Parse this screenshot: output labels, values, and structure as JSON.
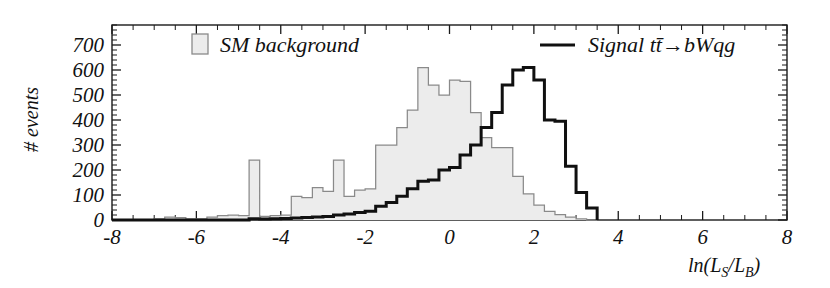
{
  "figure": {
    "name": "likelihood-ratio-discriminant",
    "width": 830,
    "height": 288
  },
  "axes": {
    "x": {
      "label": "ln(L_S/L_B)",
      "label_parts": {
        "ln_open": "ln(L",
        "sub_s": "S",
        "slash": "/L",
        "sub_b": "B",
        "close": ")"
      },
      "min": -8,
      "max": 8,
      "tick_labels": [
        "-8",
        "-6",
        "-4",
        "-2",
        "0",
        "2",
        "4",
        "6",
        "8"
      ],
      "tick_values": [
        -8,
        -6,
        -4,
        -2,
        0,
        2,
        4,
        6,
        8
      ],
      "minor_per_major": 4
    },
    "y": {
      "label": "# events",
      "min": 0,
      "max": 780,
      "tick_labels": [
        "0",
        "100",
        "200",
        "300",
        "400",
        "500",
        "600",
        "700"
      ],
      "tick_values": [
        0,
        100,
        200,
        300,
        400,
        500,
        600,
        700
      ],
      "minor_per_major": 5
    }
  },
  "legend": {
    "position": "top",
    "entries": [
      {
        "label": "SM background",
        "marker": "filled-square",
        "fill_color": "#ececec",
        "edge_color": "#8a8a8a"
      },
      {
        "label_plain": "Signal tt̄→bWqg",
        "label_prefix": "Signal t",
        "label_tbar": "t̄",
        "label_suffix": "→bWqg",
        "marker": "line",
        "line_color": "#101010"
      }
    ]
  },
  "chart_data": {
    "type": "line",
    "subtype": "step-histogram",
    "title": "",
    "xlabel": "ln(L_S/L_B)",
    "ylabel": "# events",
    "xlim": [
      -8,
      8
    ],
    "ylim": [
      0,
      780
    ],
    "grid": false,
    "legend_position": "top",
    "bin_width": 0.25,
    "bin_edges_start": -8,
    "series": [
      {
        "name": "SM background",
        "style": "filled-step",
        "fill_color": "#ececec",
        "edge_color": "#8a8a8a",
        "bin_centers": [
          -7.875,
          -7.625,
          -7.375,
          -7.125,
          -6.875,
          -6.625,
          -6.375,
          -6.125,
          -5.875,
          -5.625,
          -5.375,
          -5.125,
          -4.875,
          -4.625,
          -4.375,
          -4.125,
          -3.875,
          -3.625,
          -3.375,
          -3.125,
          -2.875,
          -2.625,
          -2.375,
          -2.125,
          -1.875,
          -1.625,
          -1.375,
          -1.125,
          -0.875,
          -0.625,
          -0.375,
          -0.125,
          0.125,
          0.375,
          0.625,
          0.875,
          1.125,
          1.375,
          1.625,
          1.875,
          2.125,
          2.375,
          2.625,
          2.875,
          3.125,
          3.375
        ],
        "values": [
          0,
          0,
          0,
          0,
          5,
          12,
          10,
          5,
          5,
          12,
          18,
          20,
          18,
          240,
          15,
          18,
          20,
          95,
          90,
          130,
          115,
          240,
          95,
          120,
          125,
          300,
          300,
          370,
          440,
          610,
          540,
          500,
          560,
          555,
          430,
          330,
          290,
          290,
          175,
          105,
          60,
          35,
          22,
          12,
          5,
          0
        ]
      },
      {
        "name": "Signal tt̄→bWqg",
        "style": "open-step",
        "edge_color": "#101010",
        "line_width": 3,
        "bin_centers": [
          -7.875,
          -7.625,
          -7.375,
          -7.125,
          -6.875,
          -6.625,
          -6.375,
          -6.125,
          -5.875,
          -5.625,
          -5.375,
          -5.125,
          -4.875,
          -4.625,
          -4.375,
          -4.125,
          -3.875,
          -3.625,
          -3.375,
          -3.125,
          -2.875,
          -2.625,
          -2.375,
          -2.125,
          -1.875,
          -1.625,
          -1.375,
          -1.125,
          -0.875,
          -0.625,
          -0.375,
          -0.125,
          0.125,
          0.375,
          0.625,
          0.875,
          1.125,
          1.375,
          1.625,
          1.875,
          2.125,
          2.375,
          2.625,
          2.875,
          3.125,
          3.375
        ],
        "values": [
          0,
          0,
          0,
          0,
          0,
          0,
          0,
          0,
          0,
          0,
          0,
          0,
          0,
          5,
          4,
          5,
          6,
          8,
          10,
          12,
          14,
          20,
          24,
          30,
          35,
          55,
          70,
          95,
          125,
          155,
          160,
          200,
          210,
          260,
          300,
          370,
          430,
          540,
          600,
          610,
          560,
          400,
          395,
          215,
          110,
          48,
          0
        ]
      }
    ]
  }
}
